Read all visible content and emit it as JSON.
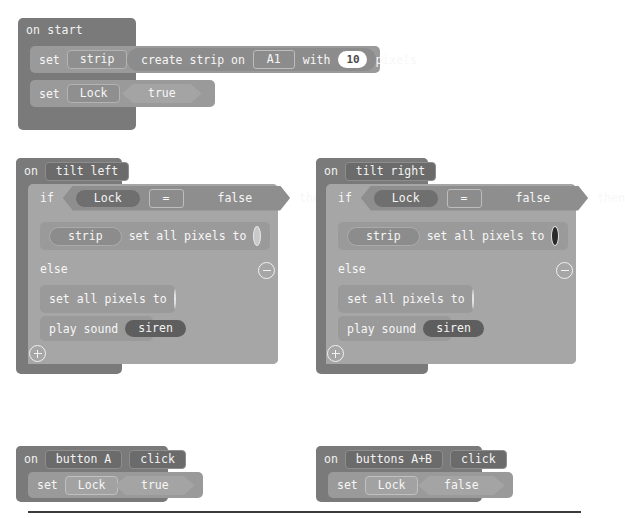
{
  "editor": {
    "background_color": "#ffffff",
    "kind": "block-editor-workspace"
  },
  "palette": {
    "event_block": "#7a7a7a",
    "statement_block": "#9a9a9a",
    "control_block": "#a6a6a6",
    "reporter_block": "#8c8c8c",
    "field_text": "#f6f6f6",
    "number_field_bg": "#ffffff",
    "divider": "#3b3b3b"
  },
  "scripts": {
    "on_start": {
      "event_label": "on start",
      "rows": [
        {
          "set_label": "set",
          "variable": "strip",
          "to_label": "to",
          "value_kind": "create-strip-reporter",
          "reporter": {
            "prefix": "create strip on",
            "pin": "A1",
            "with_label": "with",
            "count": "10",
            "suffix": "pixels"
          }
        },
        {
          "set_label": "set",
          "variable": "Lock",
          "to_label": "to",
          "value_kind": "boolean",
          "boolean": "true"
        }
      ]
    },
    "on_tilt_left": {
      "event_kw": "on",
      "event_label": "tilt left",
      "if_label": "if",
      "then_label": "then",
      "else_label": "else",
      "condition": {
        "left_variable": "Lock",
        "operator": "=",
        "right_boolean": "false"
      },
      "then_branch": [
        {
          "kind": "strip-set-all-pixels",
          "target": "strip",
          "text": "set all pixels to",
          "color": "#c9c9c9"
        }
      ],
      "else_branch": [
        {
          "kind": "set-all-pixels",
          "text": "set all pixels to",
          "color": "#4a4a4a"
        },
        {
          "kind": "play-sound",
          "text": "play sound",
          "sound": "siren"
        }
      ],
      "collapse_icon": "minus-circle-icon",
      "expand_icon": "plus-circle-icon"
    },
    "on_tilt_right": {
      "event_kw": "on",
      "event_label": "tilt right",
      "if_label": "if",
      "then_label": "then",
      "else_label": "else",
      "condition": {
        "left_variable": "Lock",
        "operator": "=",
        "right_boolean": "false"
      },
      "then_branch": [
        {
          "kind": "strip-set-all-pixels",
          "target": "strip",
          "text": "set all pixels to",
          "color": "#2a2a2a"
        }
      ],
      "else_branch": [
        {
          "kind": "set-all-pixels",
          "text": "set all pixels to",
          "color": "#5a5a5a"
        },
        {
          "kind": "play-sound",
          "text": "play sound",
          "sound": "siren"
        }
      ],
      "collapse_icon": "minus-circle-icon",
      "expand_icon": "plus-circle-icon"
    },
    "on_button_a": {
      "event_kw": "on",
      "event_target": "button A",
      "event_action": "click",
      "row": {
        "set_label": "set",
        "variable": "Lock",
        "to_label": "to",
        "boolean": "true"
      }
    },
    "on_buttons_ab": {
      "event_kw": "on",
      "event_target": "buttons A+B",
      "event_action": "click",
      "row": {
        "set_label": "set",
        "variable": "Lock",
        "to_label": "to",
        "boolean": "false"
      }
    }
  }
}
